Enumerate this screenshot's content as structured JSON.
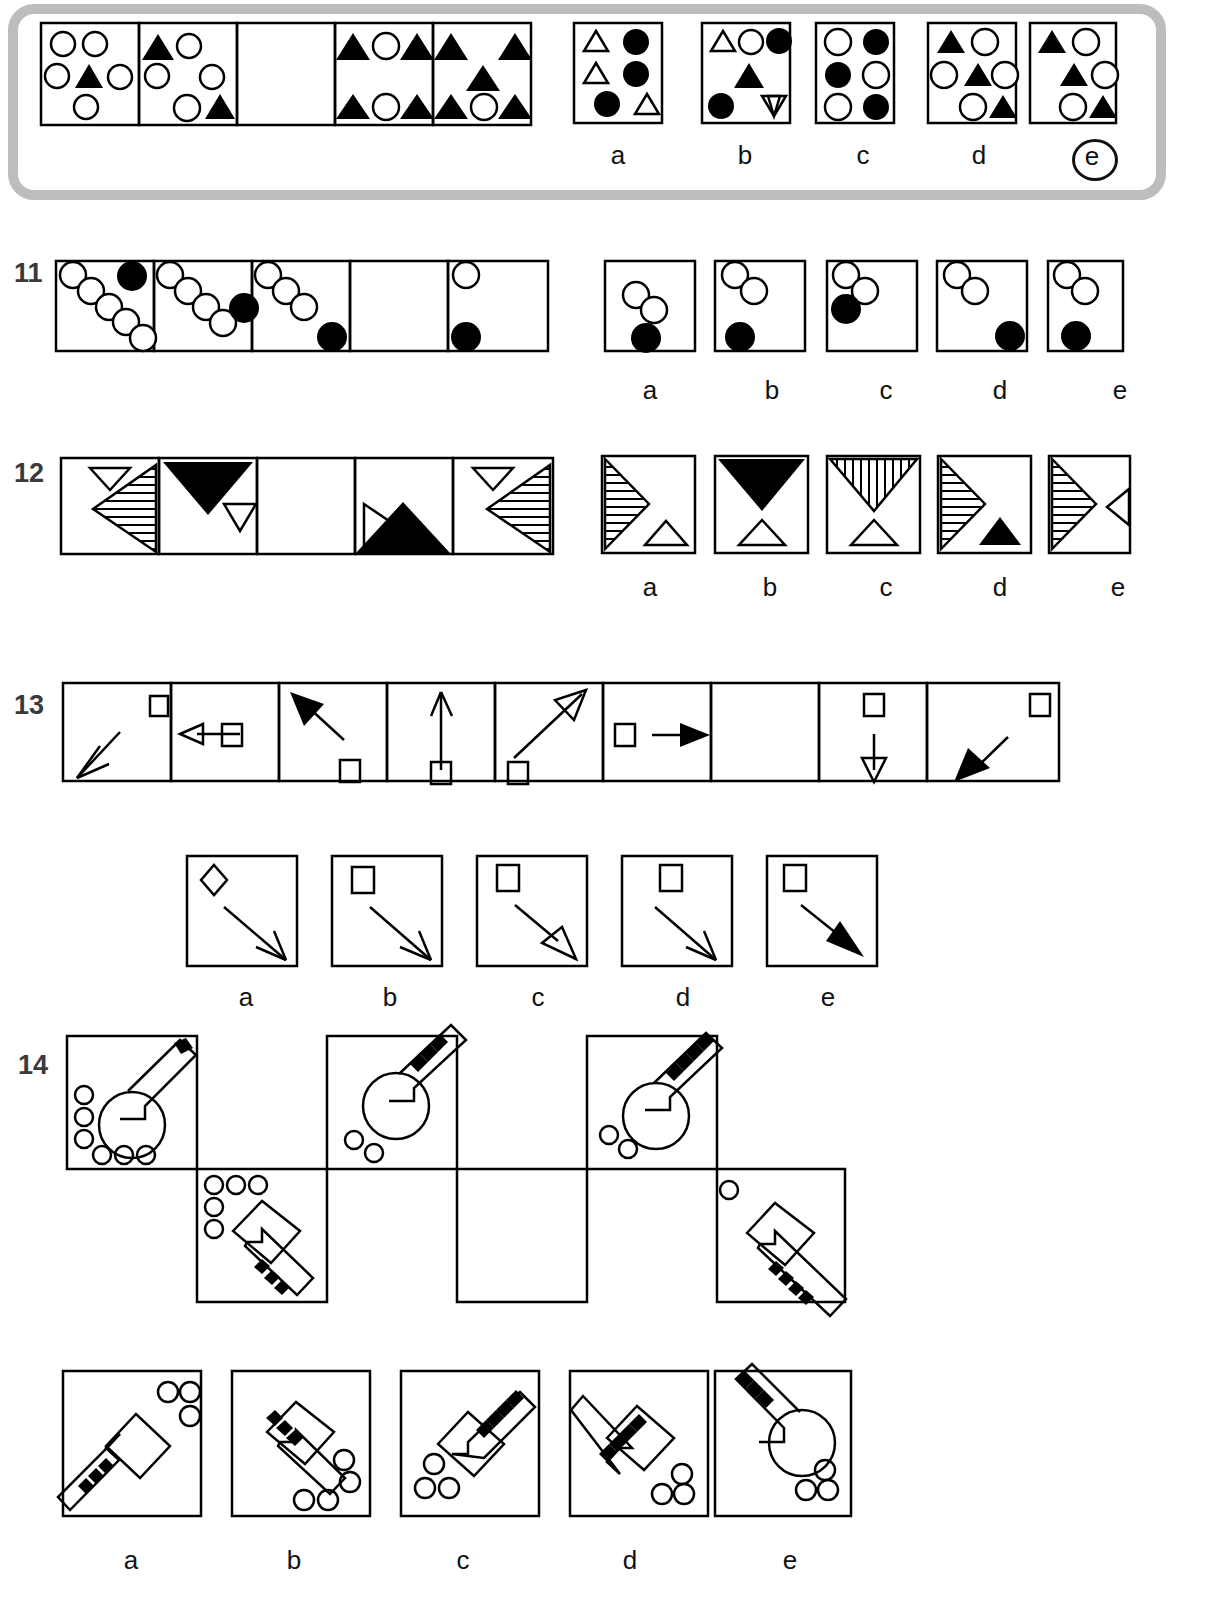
{
  "page": {
    "kind": "non-verbal-reasoning-test",
    "background": "#ffffff",
    "ink": "#000000",
    "frame_color": "#bdbdbd",
    "width": 1218,
    "height": 1613
  },
  "option_letters": [
    "a",
    "b",
    "c",
    "d",
    "e"
  ],
  "questions": [
    {
      "number": "",
      "id": "q10",
      "note": "partial question at top inside grey rounded frame",
      "sequence_panels": [
        {
          "index": 0,
          "shapes": "2 open circles top, open circle + filled triangle + open circle middle, open circle bottom"
        },
        {
          "index": 1,
          "shapes": "filled triangle + open circle top, open circle + open circle middle, open circle + filled triangle bottom"
        },
        {
          "index": 2,
          "shapes": "empty (answer slot)"
        },
        {
          "index": 3,
          "shapes": "filled triangle, open circle, filled triangle top; filled triangle, open circle, filled triangle bottom"
        },
        {
          "index": 4,
          "shapes": "filled triangle, filled triangle top; filled triangle middle; filled triangle, open circle, filled triangle bottom"
        }
      ],
      "options": [
        {
          "letter": "a",
          "desc": "open triangle + filled circle; open triangle + filled circle; filled circle + open triangle"
        },
        {
          "letter": "b",
          "desc": "open triangle, open circle, filled circle; filled triangle; filled circle, open down-triangle"
        },
        {
          "letter": "c",
          "desc": "open circle, filled circle; filled circle, open circle; open circle, filled circle"
        },
        {
          "letter": "d",
          "desc": "filled triangle, open circle; open circle, filled triangle, open circle; open circle, filled triangle"
        },
        {
          "letter": "e",
          "desc": "filled triangle, open circle; filled triangle, open circle; open circle, filled triangle"
        }
      ],
      "marked_answer": "e"
    },
    {
      "number": "11",
      "id": "q11",
      "sequence_panels": [
        {
          "index": 0,
          "desc": "6 open circles on descending diagonal, 1 filled circle top-right"
        },
        {
          "index": 1,
          "desc": "5 open circles on descending diagonal, filled circle at lower right of chain"
        },
        {
          "index": 2,
          "desc": "4 open circles on descending diagonal, filled circle bottom-right"
        },
        {
          "index": 3,
          "desc": "empty (answer slot)"
        },
        {
          "index": 4,
          "desc": "1 open circle top-left, filled circle bottom-left"
        }
      ],
      "options": [
        {
          "letter": "a",
          "desc": "2 open circles center-diagonal, filled circle bottom center"
        },
        {
          "letter": "b",
          "desc": "2 open circles upper-left diagonal, filled circle bottom-left"
        },
        {
          "letter": "c",
          "desc": "2 open circles top-left diagonal, filled circle immediately below-left"
        },
        {
          "letter": "d",
          "desc": "2 open circles top-left diagonal, filled circle bottom-right"
        },
        {
          "letter": "e",
          "desc": "2 open circles top-left diagonal, filled circle bottom-center"
        }
      ],
      "marked_answer": ""
    },
    {
      "number": "12",
      "id": "q12",
      "sequence_panels": [
        {
          "index": 0,
          "desc": "small open down-triangle top-left, large horizontally-hatched left-pointing triangle"
        },
        {
          "index": 1,
          "desc": "large filled down-triangle top, small open left-pointing triangle right"
        },
        {
          "index": 2,
          "desc": "empty (answer slot)"
        },
        {
          "index": 3,
          "desc": "small open right-pointing triangle left, large filled up-triangle bottom"
        },
        {
          "index": 4,
          "desc": "small open down-triangle top, large horizontally-hatched left-pointing triangle"
        }
      ],
      "options": [
        {
          "letter": "a",
          "desc": "hatched right-pointing triangle left, small open up-triangle bottom right"
        },
        {
          "letter": "b",
          "desc": "large filled down-triangle top, small open up-triangle bottom"
        },
        {
          "letter": "c",
          "desc": "vertically hatched down-triangle top, small open up-triangle bottom"
        },
        {
          "letter": "d",
          "desc": "hatched right-pointing triangle left, small filled up-triangle bottom right"
        },
        {
          "letter": "e",
          "desc": "hatched right-pointing triangle left, small open left-pointing triangle right"
        }
      ],
      "marked_answer": ""
    },
    {
      "number": "13",
      "id": "q13",
      "sequence_panels": [
        {
          "index": 0,
          "desc": "open square top-right, thin open arrow pointing down-left"
        },
        {
          "index": 1,
          "desc": "open square center, open arrow pointing left"
        },
        {
          "index": 2,
          "desc": "filled arrowhead pointing up-left, open square bottom"
        },
        {
          "index": 3,
          "desc": "thin open arrow pointing up, open square bottom"
        },
        {
          "index": 4,
          "desc": "open arrow pointing up-right, open square bottom-left"
        },
        {
          "index": 5,
          "desc": "open square left, filled arrow pointing right"
        },
        {
          "index": 6,
          "desc": "empty (answer slot)"
        },
        {
          "index": 7,
          "desc": "open square top, open arrow pointing down"
        },
        {
          "index": 8,
          "desc": "open square top-right, filled arrow pointing down-left"
        }
      ],
      "options": [
        {
          "letter": "a",
          "desc": "open diamond top-left, thin open arrow pointing down-right"
        },
        {
          "letter": "b",
          "desc": "open square top-left, thin open arrow pointing down-right"
        },
        {
          "letter": "c",
          "desc": "open square top-left, hollow-head arrow pointing down-right"
        },
        {
          "letter": "d",
          "desc": "open square top-center, thin open arrow pointing down-right"
        },
        {
          "letter": "e",
          "desc": "open square top-left, filled-head arrow pointing down-right"
        }
      ],
      "marked_answer": ""
    },
    {
      "number": "14",
      "id": "q14",
      "layout": "staggered two-row matrix, 5 cells upper offset, 5 cells lower offset",
      "sequence_panels": [
        {
          "index": 0,
          "row": "top",
          "desc": "circle-head key pointing up-right with single black band, 6 small circles along left and bottom"
        },
        {
          "index": 1,
          "row": "bottom",
          "desc": "hexagon-head key pointing down-right with 3 black bands, 5 small circles top-left"
        },
        {
          "index": 2,
          "row": "top",
          "desc": "circle-head key pointing down-left with 3 black bands, 5 small circles top-right"
        },
        {
          "index": 3,
          "row": "bottom",
          "desc": "empty (answer slot)"
        },
        {
          "index": 4,
          "row": "top",
          "desc": "circle-head key pointing up-right with 4 black bands, 2 small circles left"
        },
        {
          "index": 5,
          "row": "bottom",
          "desc": "hexagon-head key pointing down-right with 6 black bands, 1 small circle top-left"
        }
      ],
      "options": [
        {
          "letter": "a",
          "desc": "hexagon-head key up-left with 3 bands, 3 circles top-right"
        },
        {
          "letter": "b",
          "desc": "hexagon-head key down-right with 3 bands, 4 circles bottom-right"
        },
        {
          "letter": "c",
          "desc": "hexagon-head key up-right with 4 bands, 3 circles bottom-left"
        },
        {
          "letter": "d",
          "desc": "hexagon-head key up-left with 4 bands, 3 circles bottom-right"
        },
        {
          "letter": "e",
          "desc": "circle-head key up-left with 3 bands, 3 circles bottom-right"
        }
      ],
      "marked_answer": ""
    }
  ]
}
